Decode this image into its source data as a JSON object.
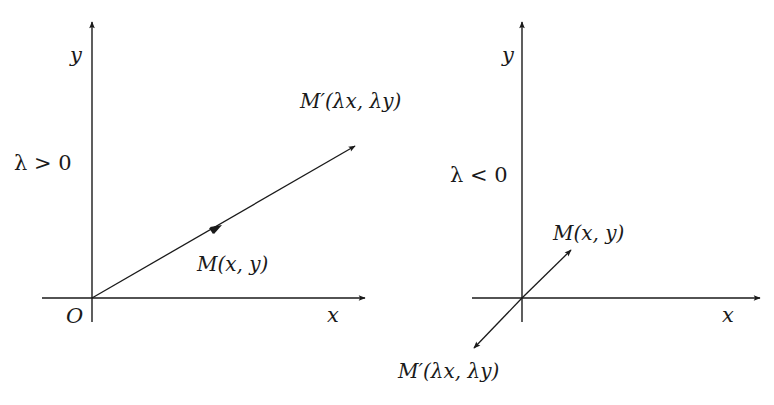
{
  "diagram": {
    "left_panel": {
      "condition": "λ > 0",
      "y_axis_label": "y",
      "x_axis_label": "x",
      "origin_label": "O",
      "point_label": "M(x, y)",
      "image_point_label": "M′(λx, λy)"
    },
    "right_panel": {
      "condition": "λ < 0",
      "y_axis_label": "y",
      "x_axis_label": "x",
      "point_label": "M(x, y)",
      "image_point_label": "M′(λx, λy)"
    },
    "colors": {
      "ink": "#1a1a1a",
      "background": "#ffffff"
    }
  }
}
